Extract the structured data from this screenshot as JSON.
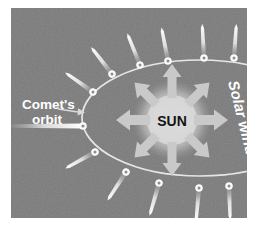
{
  "figure": {
    "background_color": "#ffffff",
    "panel_color": "#7b7b7b",
    "panel_rect": {
      "x": 11,
      "y": 8,
      "width": 236,
      "height": 210
    }
  },
  "labels": {
    "comet_orbit_line1": "Comet's",
    "comet_orbit_line2": "orbit",
    "sun": "SUN",
    "solar_wind": "Solar wind"
  },
  "colors": {
    "panel_gray": "#7b7b7b",
    "orbit_line": "#e4e4e4",
    "comet_white": "#f4f4f4",
    "arrow_gray": "#c9c9c9",
    "sun_glow": "#d2d2d2",
    "label_white": "#ffffff",
    "sun_text": "#1a1a1a"
  },
  "orbit": {
    "name": "comet-orbit-ellipse",
    "center_x": 200,
    "center_y": 118,
    "radius_x": 118,
    "radius_y": 58
  },
  "sun": {
    "center_x": 172,
    "center_y": 120,
    "core_radius": 26,
    "glow_radius": 36
  },
  "solar_wind_arrows": {
    "count": 8,
    "directions": [
      "N",
      "NE",
      "E",
      "SE",
      "S",
      "SW",
      "W",
      "NW"
    ],
    "color": "#c9c9c9"
  },
  "comets": [
    {
      "id": 1,
      "x": 93,
      "y": 92,
      "tail_angle": -145
    },
    {
      "id": 2,
      "x": 112,
      "y": 74,
      "tail_angle": -125
    },
    {
      "id": 3,
      "x": 140,
      "y": 65,
      "tail_angle": -110
    },
    {
      "id": 4,
      "x": 168,
      "y": 61,
      "tail_angle": -100
    },
    {
      "id": 5,
      "x": 204,
      "y": 58,
      "tail_angle": -92
    },
    {
      "id": 6,
      "x": 234,
      "y": 58,
      "tail_angle": -86
    },
    {
      "id": 7,
      "x": 86,
      "y": 129,
      "tail_angle": 178
    },
    {
      "id": 8,
      "x": 95,
      "y": 152,
      "tail_angle": 150
    },
    {
      "id": 9,
      "x": 126,
      "y": 172,
      "tail_angle": 122
    },
    {
      "id": 10,
      "x": 159,
      "y": 183,
      "tail_angle": 105
    },
    {
      "id": 11,
      "x": 199,
      "y": 188,
      "tail_angle": 95
    },
    {
      "id": 12,
      "x": 229,
      "y": 186,
      "tail_angle": 88
    }
  ],
  "leader_arrow": {
    "name": "comet-orbit-leader-arrow",
    "from_x": 59,
    "from_y": 110,
    "to_x": 84,
    "to_y": 114
  },
  "comet_tail_into_orbit": {
    "name": "left-comet-tail",
    "from_x": 16,
    "from_y": 126,
    "to_x": 82,
    "to_y": 126
  }
}
